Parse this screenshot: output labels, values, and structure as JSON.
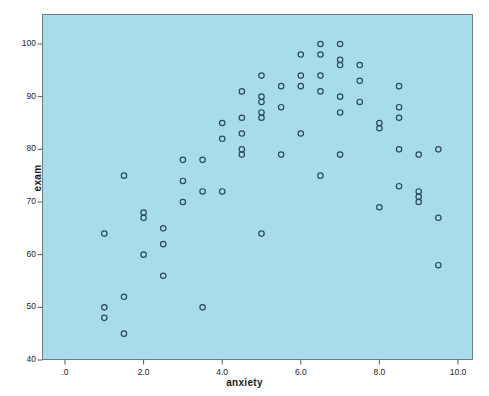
{
  "chart_data": {
    "type": "scatter",
    "title": "",
    "xlabel": "anxiety",
    "ylabel": "exam",
    "xlim": [
      -0.4,
      10.4
    ],
    "ylim": [
      40,
      104
    ],
    "grid": false,
    "legend": "none",
    "x_ticks": [
      ".0",
      "2.0",
      "4.0",
      "6.0",
      "8.0",
      "10.0"
    ],
    "x_tick_values": [
      0,
      2,
      4,
      6,
      8,
      10
    ],
    "y_ticks": [
      "40",
      "50",
      "60",
      "70",
      "80",
      "90",
      "100"
    ],
    "y_tick_values": [
      40,
      50,
      60,
      70,
      80,
      90,
      100
    ],
    "marker": "open-circle",
    "marker_color": "#2b4a5c",
    "plot_background": "#a8dcea",
    "points": [
      [
        1.0,
        64
      ],
      [
        1.0,
        50
      ],
      [
        1.0,
        48
      ],
      [
        1.5,
        75
      ],
      [
        1.5,
        52
      ],
      [
        1.5,
        45
      ],
      [
        2.0,
        68
      ],
      [
        2.0,
        67
      ],
      [
        2.0,
        60
      ],
      [
        2.5,
        65
      ],
      [
        2.5,
        62
      ],
      [
        2.5,
        56
      ],
      [
        3.0,
        78
      ],
      [
        3.0,
        74
      ],
      [
        3.0,
        70
      ],
      [
        3.5,
        78
      ],
      [
        3.5,
        72
      ],
      [
        3.5,
        50
      ],
      [
        4.0,
        85
      ],
      [
        4.0,
        82
      ],
      [
        4.0,
        72
      ],
      [
        4.5,
        91
      ],
      [
        4.5,
        86
      ],
      [
        4.5,
        83
      ],
      [
        4.5,
        80
      ],
      [
        4.5,
        79
      ],
      [
        5.0,
        94
      ],
      [
        5.0,
        90
      ],
      [
        5.0,
        89
      ],
      [
        5.0,
        87
      ],
      [
        5.0,
        86
      ],
      [
        5.0,
        64
      ],
      [
        5.5,
        92
      ],
      [
        5.5,
        88
      ],
      [
        5.5,
        79
      ],
      [
        6.0,
        98
      ],
      [
        6.0,
        94
      ],
      [
        6.0,
        92
      ],
      [
        6.0,
        83
      ],
      [
        6.5,
        100
      ],
      [
        6.5,
        98
      ],
      [
        6.5,
        94
      ],
      [
        6.5,
        91
      ],
      [
        6.5,
        75
      ],
      [
        7.0,
        100
      ],
      [
        7.0,
        97
      ],
      [
        7.0,
        96
      ],
      [
        7.0,
        90
      ],
      [
        7.0,
        87
      ],
      [
        7.0,
        79
      ],
      [
        7.5,
        96
      ],
      [
        7.5,
        93
      ],
      [
        7.5,
        89
      ],
      [
        8.0,
        85
      ],
      [
        8.0,
        84
      ],
      [
        8.0,
        69
      ],
      [
        8.5,
        92
      ],
      [
        8.5,
        88
      ],
      [
        8.5,
        86
      ],
      [
        8.5,
        80
      ],
      [
        8.5,
        73
      ],
      [
        9.0,
        79
      ],
      [
        9.0,
        72
      ],
      [
        9.0,
        71
      ],
      [
        9.0,
        70
      ],
      [
        9.5,
        80
      ],
      [
        9.5,
        67
      ],
      [
        9.5,
        58
      ]
    ]
  },
  "axes": {
    "x_title": "anxiety",
    "y_title": "exam"
  }
}
